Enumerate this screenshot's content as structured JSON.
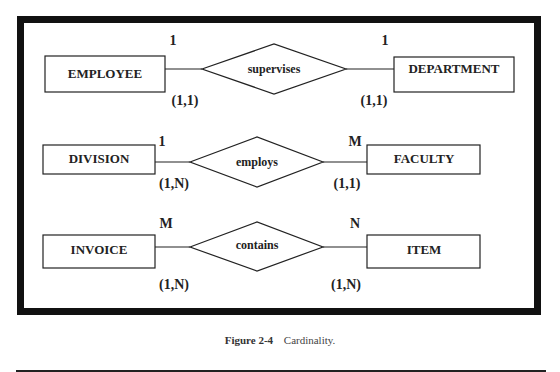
{
  "figure": {
    "label": "Figure 2-4",
    "title": "Cardinality."
  },
  "colors": {
    "ink": "#222222",
    "frame": "#111111",
    "background": "#ffffff"
  },
  "rows": [
    {
      "left_entity": "EMPLOYEE",
      "relationship": "supervises",
      "right_entity": "DEPARTMENT",
      "left_cardinality": "1",
      "right_cardinality": "1",
      "left_participation": "(1,1)",
      "right_participation": "(1,1)"
    },
    {
      "left_entity": "DIVISION",
      "relationship": "employs",
      "right_entity": "FACULTY",
      "left_cardinality": "1",
      "right_cardinality": "M",
      "left_participation": "(1,N)",
      "right_participation": "(1,1)"
    },
    {
      "left_entity": "INVOICE",
      "relationship": "contains",
      "right_entity": "ITEM",
      "left_cardinality": "M",
      "right_cardinality": "N",
      "left_participation": "(1,N)",
      "right_participation": "(1,N)"
    }
  ]
}
